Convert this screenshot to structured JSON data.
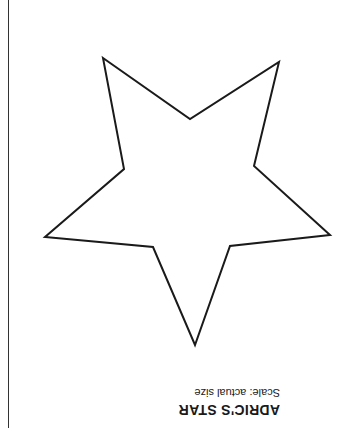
{
  "document": {
    "title": "ADRIC'S STAR",
    "scale_note": "Scale: actual size",
    "orientation": "rotated 180 degrees",
    "shape": {
      "name": "five-pointed-star",
      "stroke_color": "#1a1a1a",
      "points": "103,58 190,119 279,62 254,166 330,235 230,246 195,345 153,247 45,237 124,169"
    }
  }
}
